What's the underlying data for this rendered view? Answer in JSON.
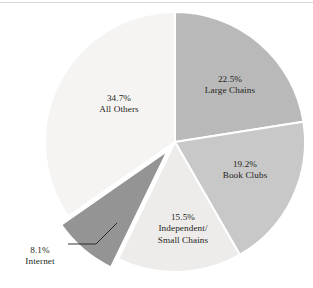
{
  "chart_data": {
    "type": "pie",
    "title": "",
    "subtitle": "",
    "xlabel": "",
    "ylabel": "",
    "legend_position": "none",
    "grid": false,
    "units": "percent",
    "start_angle_deg": 0,
    "direction": "clockwise",
    "categories": [
      "Large Chains",
      "Book Clubs",
      "Independent/Small Chains",
      "Internet",
      "All Others"
    ],
    "values": [
      22.5,
      19.2,
      15.5,
      8.1,
      34.7
    ],
    "slices": [
      {
        "name": "Large Chains",
        "value": 22.5,
        "value_label": "22.5%",
        "label_line1": "22.5%",
        "label_line2": "Large Chains",
        "label_line3": "",
        "color": "#b9b9b9",
        "exploded": false,
        "label_inside": true,
        "label_x": 230,
        "label_y": 82
      },
      {
        "name": "Book Clubs",
        "value": 19.2,
        "value_label": "19.2%",
        "label_line1": "19.2%",
        "label_line2": "Book Clubs",
        "label_line3": "",
        "color": "#c8c8c8",
        "exploded": false,
        "label_inside": true,
        "label_x": 245,
        "label_y": 167
      },
      {
        "name": "Independent/Small Chains",
        "value": 15.5,
        "value_label": "15.5%",
        "label_line1": "15.5%",
        "label_line2": "Independent/",
        "label_line3": "Small Chains",
        "color": "#eeecea",
        "exploded": false,
        "label_inside": true,
        "label_x": 183,
        "label_y": 220
      },
      {
        "name": "Internet",
        "value": 8.1,
        "value_label": "8.1%",
        "label_line1": "8.1%",
        "label_line2": "Internet",
        "label_line3": "",
        "color": "#949494",
        "exploded": true,
        "label_inside": false,
        "label_x": 40,
        "label_y": 253
      },
      {
        "name": "All Others",
        "value": 34.7,
        "value_label": "34.7%",
        "label_line1": "34.7%",
        "label_line2": "All Others",
        "label_line3": "",
        "color": "#f5f4f2",
        "exploded": false,
        "label_inside": true,
        "label_x": 119,
        "label_y": 101
      }
    ],
    "colors": {
      "large_chains": "#b9b9b9",
      "book_clubs": "#c8c8c8",
      "independent_small_chains": "#eeecea",
      "internet": "#949494",
      "all_others": "#f5f4f2",
      "text": "#241f1c",
      "outline": "#ffffff",
      "background": "#ffffff",
      "rule": "#d8d8d8"
    }
  },
  "figure": {
    "center_x": 175,
    "center_y": 142,
    "radius": 130,
    "leader_line": {
      "name": "internet-leader-line",
      "points": "68,244 96,244 117,223"
    }
  }
}
